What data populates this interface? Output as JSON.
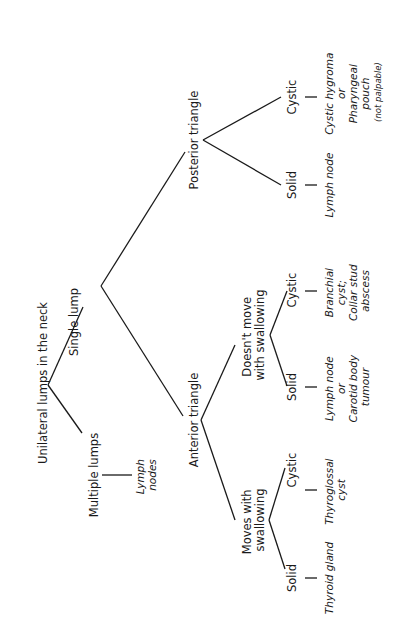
{
  "title": "Unilateral lumps in the neck",
  "nodes": {
    "multiple": "Multiple lumps",
    "multiple_result": [
      "Lymph",
      "nodes"
    ],
    "single": "Single lump",
    "anterior": "Anterior triangle",
    "posterior": "Posterior triangle",
    "moves": [
      "Moves with",
      "swallowing"
    ],
    "doesnt_move": [
      "Doesn't move",
      "with swallowing"
    ],
    "moves_solid": "Solid",
    "moves_solid_result": "Thyroid gland",
    "moves_cystic": "Cystic",
    "moves_cystic_result": [
      "Thyroglossal",
      "cyst"
    ],
    "dm_solid": "Solid",
    "dm_solid_result": [
      "Lymph node",
      "or",
      "Carotid body",
      "tumour"
    ],
    "dm_cystic": "Cystic",
    "dm_cystic_result": [
      "Branchial",
      "cyst;",
      "Collar stud",
      "abscess"
    ],
    "post_solid": "Solid",
    "post_solid_result": "Lymph node",
    "post_cystic": "Cystic",
    "post_cystic_result": [
      "Cystic hygroma",
      "or",
      "Pharyngeal",
      "pouch",
      "(not palpable)"
    ]
  }
}
